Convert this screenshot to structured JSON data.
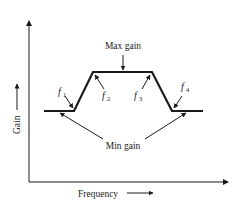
{
  "diagram": {
    "type": "filter-gain-vs-frequency",
    "axes": {
      "x_label": "Frequency",
      "y_label": "Gain"
    },
    "labels": {
      "max_gain": "Max gain",
      "min_gain": "Min gain",
      "f1": "f",
      "f1_sub": "1",
      "f2": "f",
      "f2_sub": "2",
      "f3": "f",
      "f3_sub": "3",
      "f4": "f",
      "f4_sub": "4"
    },
    "colors": {
      "line": "#1a1a1a",
      "background": "#ffffff"
    }
  }
}
